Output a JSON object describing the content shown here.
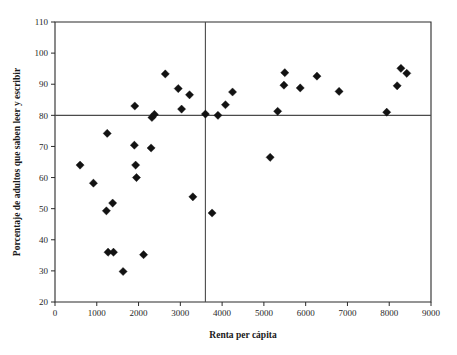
{
  "chart_data": {
    "type": "scatter",
    "title": "",
    "xlabel": "Renta per cápita",
    "ylabel": "Porcentaje de adultos que saben leer y escribir",
    "xlim": [
      0,
      9000
    ],
    "ylim": [
      20,
      110
    ],
    "xticks": [
      0,
      1000,
      2000,
      3000,
      4000,
      5000,
      6000,
      7000,
      8000,
      9000
    ],
    "yticks": [
      20,
      30,
      40,
      50,
      60,
      70,
      80,
      90,
      100,
      110
    ],
    "xtick_labels": [
      "0",
      "1000",
      "2000",
      "3000",
      "4000",
      "5000",
      "6000",
      "7000",
      "8000",
      "9000"
    ],
    "ytick_labels": [
      "20",
      "30",
      "40",
      "50",
      "60",
      "70",
      "80",
      "90",
      "100",
      "110"
    ],
    "grid": false,
    "legend": false,
    "marker": "diamond",
    "marker_color": "#121212",
    "reference_lines": [
      {
        "orientation": "horizontal",
        "value": 80,
        "axis": "y",
        "color": "#4a4a4a"
      },
      {
        "orientation": "vertical",
        "value": 3600,
        "axis": "x",
        "color": "#4a4a4a"
      }
    ],
    "points": [
      {
        "x": 600,
        "y": 64.0
      },
      {
        "x": 920,
        "y": 58.2
      },
      {
        "x": 1230,
        "y": 49.3
      },
      {
        "x": 1250,
        "y": 74.2
      },
      {
        "x": 1270,
        "y": 36.0
      },
      {
        "x": 1380,
        "y": 51.8
      },
      {
        "x": 1400,
        "y": 36.0
      },
      {
        "x": 1630,
        "y": 29.8
      },
      {
        "x": 1900,
        "y": 70.4
      },
      {
        "x": 1910,
        "y": 83.0
      },
      {
        "x": 1930,
        "y": 64.0
      },
      {
        "x": 1950,
        "y": 60.0
      },
      {
        "x": 2120,
        "y": 35.2
      },
      {
        "x": 2300,
        "y": 69.5
      },
      {
        "x": 2320,
        "y": 79.3
      },
      {
        "x": 2380,
        "y": 80.3
      },
      {
        "x": 2640,
        "y": 93.3
      },
      {
        "x": 2950,
        "y": 88.6
      },
      {
        "x": 3030,
        "y": 82.0
      },
      {
        "x": 3220,
        "y": 86.6
      },
      {
        "x": 3300,
        "y": 53.8
      },
      {
        "x": 3600,
        "y": 80.4
      },
      {
        "x": 3760,
        "y": 48.6
      },
      {
        "x": 3900,
        "y": 80.0
      },
      {
        "x": 4080,
        "y": 83.4
      },
      {
        "x": 4250,
        "y": 87.5
      },
      {
        "x": 5150,
        "y": 66.5
      },
      {
        "x": 5330,
        "y": 81.3
      },
      {
        "x": 5480,
        "y": 89.7
      },
      {
        "x": 5500,
        "y": 93.7
      },
      {
        "x": 5870,
        "y": 88.8
      },
      {
        "x": 6270,
        "y": 92.6
      },
      {
        "x": 6800,
        "y": 87.7
      },
      {
        "x": 7940,
        "y": 81.0
      },
      {
        "x": 8190,
        "y": 89.5
      },
      {
        "x": 8280,
        "y": 95.1
      },
      {
        "x": 8420,
        "y": 93.5
      }
    ]
  },
  "figure": {
    "background": "#ffffff",
    "axis_color": "#2b2b2b",
    "reference_line_color": "#4a4a4a"
  }
}
